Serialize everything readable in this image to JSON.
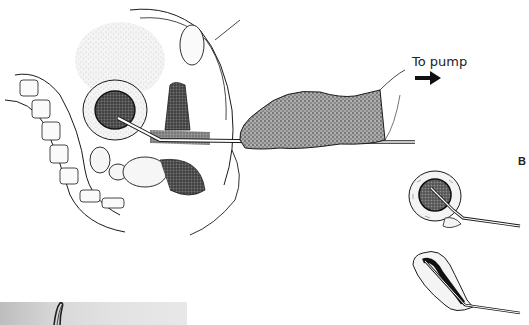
{
  "figure": {
    "domain": "medical-illustration",
    "labels": {
      "pump": "To pump",
      "panel_b": "B"
    },
    "icons": {
      "pump_arrow": "arrow-right-icon"
    },
    "panels": [
      {
        "id": "A",
        "description": "sagittal pelvic section with gloved hand inserting suction cannula into uterus"
      },
      {
        "id": "B-top",
        "description": "uterus with cannula, cavity filled with contents"
      },
      {
        "id": "B-bottom",
        "description": "uterus collapsed around cannula after evacuation"
      },
      {
        "id": "photo",
        "description": "grayscale photograph strip showing curved instrument"
      }
    ],
    "colors": {
      "ink": "#1a1a1a",
      "stipple": "#8a8a8a",
      "photo_bg": "#d6d6d6",
      "background": "#ffffff"
    }
  }
}
